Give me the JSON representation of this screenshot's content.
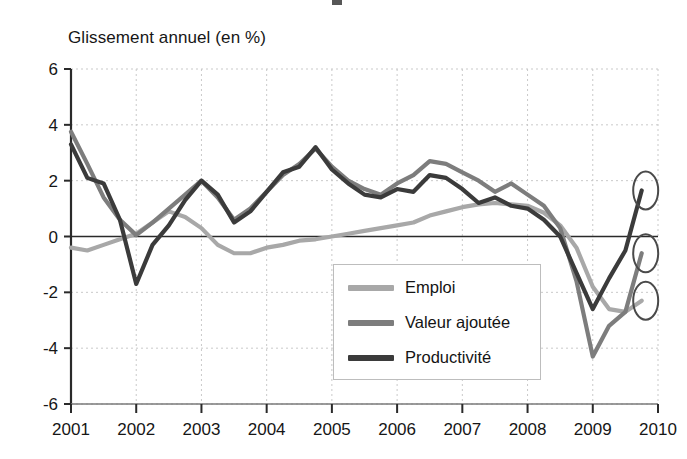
{
  "axis_caption": "Glissement annuel (en %)",
  "legend": {
    "items": [
      {
        "label": "Emploi",
        "color": "#a8a8a8"
      },
      {
        "label": "Valeur ajoutée",
        "color": "#7d7d7d"
      },
      {
        "label": "Productivité",
        "color": "#3b3b3b"
      }
    ]
  },
  "chart_data": {
    "type": "line",
    "title": "",
    "xlabel": "",
    "ylabel": "Glissement annuel (en %)",
    "xlim": [
      2001,
      2010
    ],
    "ylim": [
      -6,
      6
    ],
    "grid": true,
    "legend_position": "center",
    "x_tick_labels": [
      "2001",
      "2002",
      "2003",
      "2004",
      "2005",
      "2006",
      "2007",
      "2008",
      "2009",
      "2010"
    ],
    "y_tick_labels": [
      "6",
      "4",
      "2",
      "0",
      "-2",
      "-4",
      "-6"
    ],
    "y_ticks": [
      6,
      4,
      2,
      0,
      -2,
      -4,
      -6
    ],
    "x": [
      2001.0,
      2001.25,
      2001.5,
      2001.75,
      2002.0,
      2002.25,
      2002.5,
      2002.75,
      2003.0,
      2003.25,
      2003.5,
      2003.75,
      2004.0,
      2004.25,
      2004.5,
      2004.75,
      2005.0,
      2005.25,
      2005.5,
      2005.75,
      2006.0,
      2006.25,
      2006.5,
      2006.75,
      2007.0,
      2007.25,
      2007.5,
      2007.75,
      2008.0,
      2008.25,
      2008.5,
      2008.75,
      2009.0,
      2009.25,
      2009.5,
      2009.75
    ],
    "series": [
      {
        "name": "Emploi",
        "color": "#a8a8a8",
        "values": [
          -0.4,
          -0.5,
          -0.3,
          -0.1,
          0.1,
          0.5,
          0.9,
          0.7,
          0.3,
          -0.3,
          -0.6,
          -0.6,
          -0.4,
          -0.3,
          -0.15,
          -0.1,
          0.0,
          0.1,
          0.2,
          0.3,
          0.4,
          0.5,
          0.75,
          0.9,
          1.05,
          1.15,
          1.2,
          1.15,
          1.1,
          0.85,
          0.4,
          -0.4,
          -1.8,
          -2.6,
          -2.7,
          -2.3
        ]
      },
      {
        "name": "Valeur ajoutée",
        "color": "#7d7d7d",
        "values": [
          3.75,
          2.6,
          1.4,
          0.6,
          0.05,
          0.5,
          1.0,
          1.5,
          2.0,
          1.4,
          0.6,
          1.0,
          1.6,
          2.2,
          2.6,
          3.15,
          2.5,
          2.0,
          1.7,
          1.5,
          1.9,
          2.2,
          2.7,
          2.6,
          2.3,
          2.0,
          1.6,
          1.9,
          1.5,
          1.1,
          0.3,
          -1.6,
          -4.3,
          -3.2,
          -2.7,
          -0.6
        ]
      },
      {
        "name": "Productivité",
        "color": "#3b3b3b",
        "values": [
          3.3,
          2.1,
          1.9,
          0.6,
          -1.7,
          -0.3,
          0.4,
          1.3,
          2.0,
          1.5,
          0.5,
          0.9,
          1.6,
          2.3,
          2.5,
          3.2,
          2.4,
          1.9,
          1.5,
          1.4,
          1.7,
          1.6,
          2.2,
          2.1,
          1.7,
          1.2,
          1.4,
          1.1,
          1.0,
          0.6,
          0.0,
          -1.3,
          -2.6,
          -1.5,
          -0.5,
          1.65
        ]
      }
    ],
    "annotations": [
      {
        "type": "ellipse-highlight",
        "series": "Productivité",
        "x": 2009.75,
        "y": 1.65
      },
      {
        "type": "ellipse-highlight",
        "series": "Valeur ajoutée",
        "x": 2009.75,
        "y": -0.6
      },
      {
        "type": "ellipse-highlight",
        "series": "Emploi",
        "x": 2009.75,
        "y": -2.3
      }
    ]
  }
}
